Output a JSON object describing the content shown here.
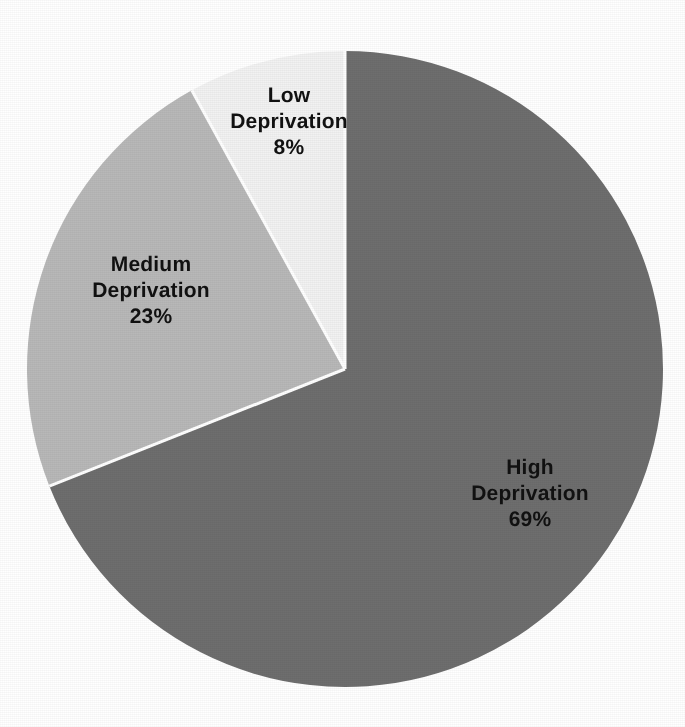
{
  "chart_data": {
    "type": "pie",
    "title": "",
    "subtitle": "",
    "xlabel": "",
    "ylabel": "",
    "legend_position": "none",
    "grid": false,
    "labels_inside_slices": true,
    "categories": [
      "High Deprivation",
      "Medium Deprivation",
      "Low Deprivation"
    ],
    "values": [
      69,
      23,
      8
    ],
    "value_unit": "%",
    "slices": [
      {
        "name": "High Deprivation",
        "value": 69,
        "value_text": "69%",
        "color": "#6e6e6e",
        "label_lines": [
          "High",
          "Deprivation",
          "69%"
        ],
        "start_angle_deg": 0,
        "sweep_deg": 248.4
      },
      {
        "name": "Medium Deprivation",
        "value": 23,
        "value_text": "23%",
        "color": "#b8b8b8",
        "label_lines": [
          "Medium",
          "Deprivation",
          "23%"
        ],
        "start_angle_deg": 248.4,
        "sweep_deg": 82.8
      },
      {
        "name": "Low Deprivation",
        "value": 8,
        "value_text": "8%",
        "color": "#f2f2f2",
        "label_lines": [
          "Low",
          "Deprivation",
          "8%"
        ],
        "start_angle_deg": 331.2,
        "sweep_deg": 28.8
      }
    ]
  },
  "pie": {
    "center_x": 345,
    "center_y": 369,
    "radius": 318,
    "separator_color": "#ffffff",
    "separator_width": 3,
    "background": "#ffffff"
  },
  "labels": {
    "high": {
      "line1": "High",
      "line2": "Deprivation",
      "line3": "69%",
      "x": 530,
      "y": 494
    },
    "medium": {
      "line1": "Medium",
      "line2": "Deprivation",
      "line3": "23%",
      "x": 151,
      "y": 291
    },
    "low": {
      "line1": "Low",
      "line2": "Deprivation",
      "line3": "8%",
      "x": 289,
      "y": 122
    }
  }
}
